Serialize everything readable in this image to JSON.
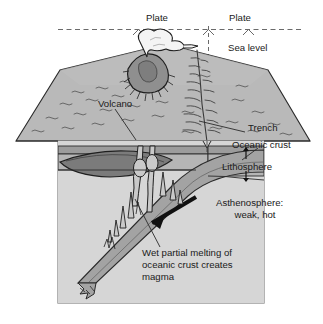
{
  "figure": {
    "type": "geologic-block-diagram",
    "background_color": "#ffffff",
    "frame_color": "#8a8a8a"
  },
  "labels": {
    "plate_left": "Plate",
    "plate_right": "Plate",
    "sea_level": "Sea level",
    "volcano": "Volcano",
    "trench": "Trench",
    "oceanic_crust": "Oceanic crust",
    "lithosphere": "Lithosphere",
    "asthenosphere_line1": "Asthenosphere:",
    "asthenosphere_line2": "weak, hot",
    "melting_line1": "Wet partial melting of",
    "melting_line2": "oceanic crust creates",
    "melting_line3": "magma"
  },
  "colors": {
    "ocean_surface": "#b9b9b9",
    "ocean_surface_dark": "#ababab",
    "asthenosphere": "#d2d2d2",
    "lithosphere_band": "#a8a8a8",
    "crust_band": "#9a9a9a",
    "slab": "#9f9f9f",
    "volcano_cone": "#8d8d8d",
    "plume": "#f2f2f2",
    "magma_chamber": "#6e6e6e",
    "outline": "#2a2a2a",
    "text": "#1a1a1a",
    "arrow": "#111111"
  },
  "annotations": {
    "plate_divider_style": "dashed-vertical",
    "lithosphere_thickness_markers": "double-headed vertical arrows",
    "subduction_arrow": "thick black arrow pointing down-left along slab",
    "leader_lines": [
      "volcano-to-cone",
      "trench-to-ridge",
      "melting-to-slab",
      "oceanic-crust-to-band"
    ]
  }
}
